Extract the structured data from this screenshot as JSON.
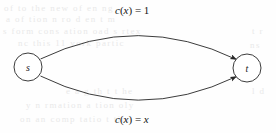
{
  "figure": {
    "caption_present": false,
    "nodes": [
      {
        "id": "s",
        "label": "s",
        "cx": 28,
        "cy": 67,
        "r": 14
      },
      {
        "id": "t",
        "label": "t",
        "cx": 247,
        "cy": 68,
        "r": 14
      }
    ],
    "edges": [
      {
        "id": "top-edge",
        "from": "s",
        "to": "t",
        "label": "c(x) = 1",
        "label_parts": {
          "func": "c",
          "open": "(",
          "var": "x",
          "close": ")",
          "eq": " = ",
          "value": "1"
        },
        "label_x": 115,
        "label_y": 4,
        "curve": "upper"
      },
      {
        "id": "bottom-edge",
        "from": "s",
        "to": "t",
        "label": "c(x) = x",
        "label_parts": {
          "func": "c",
          "open": "(",
          "var": "x",
          "close": ")",
          "eq": " = ",
          "value": "x"
        },
        "label_x": 115,
        "label_y": 113,
        "curve": "lower"
      }
    ],
    "colors": {
      "stroke": "#262626",
      "node_fill": "#ffffff",
      "text": "#141414",
      "background": "#fefefe",
      "ghost_text": "#e9e9e9"
    }
  },
  "background_ghost_text": {
    "note": "faint illegible bleed-through from reverse side of scanned page",
    "lines": [
      {
        "text": "of  to  the  new  of  en  ng",
        "x": 4,
        "y": 3
      },
      {
        "text": "a  of  tion  n  ro  d  en  t  m",
        "x": 6,
        "y": 14
      },
      {
        "text": "s  form  cons  ation  oad  s  rtex",
        "x": 3,
        "y": 26
      },
      {
        "text": "nc   this   11   vork   partic",
        "x": 18,
        "y": 38
      },
      {
        "text": "t  r",
        "x": 252,
        "y": 26
      },
      {
        "text": "ns",
        "x": 250,
        "y": 40
      },
      {
        "text": "e  a  g  th  t  t  he",
        "x": 66,
        "y": 86
      },
      {
        "text": "y   n   rmation   a   tion   oly",
        "x": 26,
        "y": 100
      },
      {
        "text": "on   an   comp   tatio   t   tim",
        "x": 20,
        "y": 114
      },
      {
        "text": "l  d",
        "x": 252,
        "y": 86
      }
    ]
  }
}
